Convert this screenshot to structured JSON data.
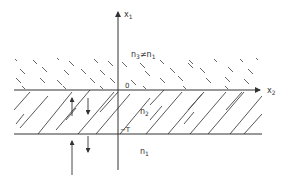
{
  "diagram": {
    "type": "layered-medium-cross-section",
    "colors": {
      "line": "#333333",
      "hatch": "#444444",
      "background": "#ffffff"
    },
    "axes": {
      "vertical": {
        "label": "x",
        "subscript": "1"
      },
      "horizontal": {
        "label": "x",
        "subscript": "2"
      }
    },
    "regions": {
      "top": {
        "label": "n",
        "subscript": "3",
        "relation": "≠",
        "rhs": "n",
        "rhs_subscript": "1",
        "hatch": "backslash-dashes"
      },
      "middle": {
        "label": "n",
        "subscript": "2",
        "hatch": "forward-slash"
      },
      "bottom": {
        "label": "n",
        "subscript": "1",
        "hatch": "none"
      }
    },
    "interfaces": {
      "top": {
        "label": "0"
      },
      "bottom": {
        "label": "−T"
      }
    },
    "arrows": [
      {
        "id": "up-in-layer",
        "direction": "up"
      },
      {
        "id": "down-in-layer",
        "direction": "down"
      },
      {
        "id": "up-incident-below",
        "direction": "up"
      },
      {
        "id": "down-transmitted-below",
        "direction": "down"
      }
    ]
  }
}
